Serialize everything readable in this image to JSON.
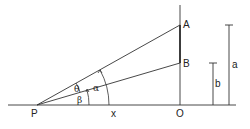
{
  "diagram": {
    "title": "",
    "points": {
      "P": {
        "label": "P",
        "x": 37,
        "y": 105
      },
      "O": {
        "label": "O",
        "x": 180,
        "y": 105
      },
      "A": {
        "label": "A",
        "x": 180,
        "y": 25
      },
      "B": {
        "label": "B",
        "x": 180,
        "y": 63
      }
    },
    "angles": {
      "theta": "θ",
      "alpha": "α",
      "beta": "β"
    },
    "lengths": {
      "x": "x",
      "a": "a",
      "b": "b"
    },
    "colors": {
      "line": "#333333",
      "text": "#222222",
      "background": "#ffffff"
    }
  }
}
